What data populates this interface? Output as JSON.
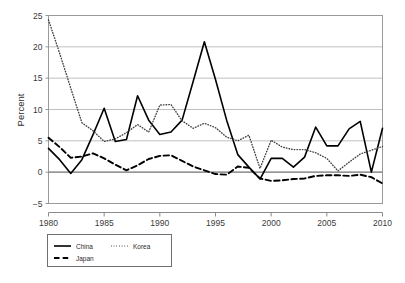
{
  "chart_data": {
    "type": "line",
    "title": "",
    "subtitle": "",
    "xlabel": "",
    "ylabel": "Percent",
    "xlim": [
      1980,
      2010
    ],
    "ylim": [
      -5,
      25
    ],
    "yticks": [
      -5,
      0,
      5,
      10,
      15,
      20,
      25
    ],
    "ytick_labels": [
      "−5",
      "0",
      "5",
      "10",
      "15",
      "20",
      "25"
    ],
    "xticks": [
      1980,
      1985,
      1990,
      1995,
      2000,
      2005,
      2010
    ],
    "xtick_labels": [
      "1980",
      "1985",
      "1990",
      "1995",
      "2000",
      "2005",
      "2010"
    ],
    "grid": "horizontal",
    "legend_position": "below-left",
    "x": [
      1980,
      1981,
      1982,
      1983,
      1984,
      1985,
      1986,
      1987,
      1988,
      1989,
      1990,
      1991,
      1992,
      1993,
      1994,
      1995,
      1996,
      1997,
      1998,
      1999,
      2000,
      2001,
      2002,
      2003,
      2004,
      2005,
      2006,
      2007,
      2008,
      2009,
      2010
    ],
    "series": [
      {
        "name": "China",
        "style": "solid",
        "color": "#000000",
        "values": [
          3.8,
          2.0,
          -0.2,
          2.0,
          6.0,
          10.2,
          4.9,
          5.2,
          12.2,
          8.3,
          6.0,
          6.4,
          8.3,
          14.5,
          20.8,
          14.8,
          8.3,
          2.8,
          0.8,
          -1.1,
          2.2,
          2.2,
          0.8,
          2.4,
          7.2,
          4.2,
          4.2,
          6.9,
          8.1,
          0.0,
          7.0
        ]
      },
      {
        "name": "Korea",
        "style": "dotted",
        "color": "#444444",
        "values": [
          24.3,
          19.0,
          13.4,
          7.9,
          6.6,
          4.9,
          5.3,
          6.3,
          7.6,
          6.4,
          10.7,
          10.8,
          8.2,
          7.0,
          7.8,
          7.1,
          5.6,
          5.0,
          5.9,
          0.6,
          5.1,
          4.0,
          3.6,
          3.6,
          3.1,
          2.2,
          0.2,
          1.6,
          2.9,
          3.5,
          4.1
        ]
      },
      {
        "name": "Japan",
        "style": "dashed",
        "color": "#000000",
        "values": [
          5.5,
          4.0,
          2.3,
          2.5,
          3.0,
          2.2,
          1.2,
          0.3,
          1.1,
          2.1,
          2.6,
          2.7,
          1.8,
          0.9,
          0.3,
          -0.3,
          -0.4,
          0.9,
          0.7,
          -1.0,
          -1.4,
          -1.3,
          -1.1,
          -1.0,
          -0.6,
          -0.5,
          -0.5,
          -0.6,
          -0.4,
          -0.8,
          -1.8
        ]
      }
    ]
  },
  "legend": {
    "entries": [
      {
        "label": "China",
        "style": "solid"
      },
      {
        "label": "Korea",
        "style": "dotted"
      },
      {
        "label": "Japan",
        "style": "dashed"
      }
    ]
  },
  "axes": {
    "y_title": "Percent"
  }
}
